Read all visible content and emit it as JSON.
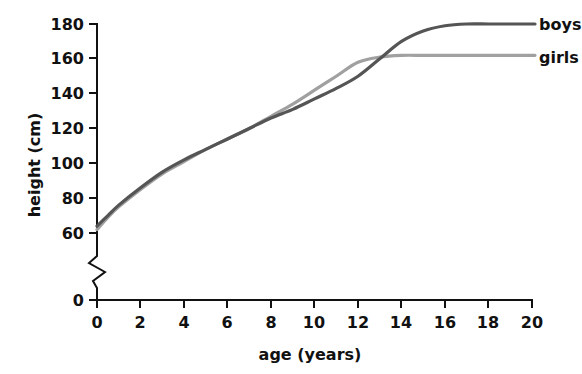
{
  "chart_data": {
    "type": "line",
    "title": "",
    "subtitle": "",
    "xlabel": "age (years)",
    "ylabel": "height (cm)",
    "xlim": [
      0,
      20
    ],
    "ylim": [
      0,
      180
    ],
    "y_axis_break": {
      "present": true,
      "between": [
        0,
        60
      ],
      "note": "zigzag break on vertical axis between 0 and 60"
    },
    "grid": false,
    "legend_position": "right-inline",
    "xticks": [
      0,
      2,
      4,
      6,
      8,
      10,
      12,
      14,
      16,
      18,
      20
    ],
    "xtick_labels": [
      "0",
      "2",
      "4",
      "6",
      "8",
      "10",
      "12",
      "14",
      "16",
      "18",
      "20"
    ],
    "yticks": [
      0,
      60,
      80,
      100,
      120,
      140,
      160,
      180
    ],
    "ytick_labels": [
      "0",
      "60",
      "80",
      "100",
      "120",
      "140",
      "160",
      "180"
    ],
    "x": [
      0,
      0.5,
      1,
      2,
      3,
      4,
      5,
      6,
      7,
      8,
      9,
      10,
      11,
      12,
      13,
      14,
      15,
      16,
      17,
      18,
      19,
      20
    ],
    "series": [
      {
        "name": "boys",
        "label": "boys",
        "color": "#555555",
        "values": [
          64,
          70,
          76,
          86,
          95,
          102,
          108,
          114,
          120,
          126,
          131,
          137,
          143,
          150,
          160,
          170,
          176,
          179,
          180,
          180,
          180,
          180
        ]
      },
      {
        "name": "girls",
        "label": "girls",
        "color": "#a0a0a0",
        "values": [
          62,
          69,
          75,
          85,
          94,
          101,
          108,
          114,
          120,
          127,
          134,
          142,
          150,
          158,
          161,
          162,
          162,
          162,
          162,
          162,
          162,
          162
        ]
      }
    ]
  },
  "axes": {
    "x_label": "age (years)",
    "y_label": "height (cm)"
  },
  "legend": {
    "boys_label": "boys",
    "girls_label": "girls"
  },
  "colors": {
    "boys": "#555555",
    "girls": "#a0a0a0",
    "axis": "#111111",
    "background": "#ffffff"
  }
}
